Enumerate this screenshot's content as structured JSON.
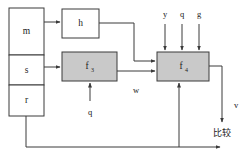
{
  "diagram": {
    "title": "",
    "colors": {
      "stroke": "#3a3a3a",
      "fill_gray": "#c9c9c9",
      "fill_white": "#ffffff",
      "text": "#1a1a1a"
    },
    "register_stack": {
      "name": "register-stack",
      "cells": [
        {
          "label": "m"
        },
        {
          "label": "s"
        },
        {
          "label": "r"
        }
      ]
    },
    "blocks": [
      {
        "id": "h",
        "label": "h",
        "subscript": "",
        "filled": false
      },
      {
        "id": "f3",
        "label": "f",
        "subscript": "3",
        "filled": true
      },
      {
        "id": "f4",
        "label": "f",
        "subscript": "4",
        "filled": true
      }
    ],
    "signals": {
      "top_inputs": [
        {
          "label": "y"
        },
        {
          "label": "q"
        },
        {
          "label": "g"
        }
      ],
      "f3_bottom_input": "q",
      "intermediate": "w",
      "output": "v"
    },
    "terminal": {
      "label": "比较"
    }
  }
}
